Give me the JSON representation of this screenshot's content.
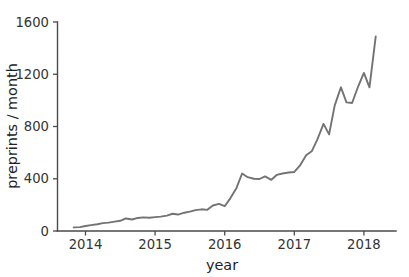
{
  "chart_data": {
    "type": "line",
    "title": "",
    "xlabel": "year",
    "ylabel": "preprints / month",
    "xlim": [
      2013.83,
      2018.25
    ],
    "ylim": [
      0,
      1600
    ],
    "grid": false,
    "legend": false,
    "legend_position": "none",
    "xticks": [
      2014,
      2015,
      2016,
      2017,
      2018
    ],
    "xtick_labels": [
      "2014",
      "2015",
      "2016",
      "2017",
      "2018"
    ],
    "yticks": [
      0,
      400,
      800,
      1200,
      1600
    ],
    "ytick_labels": [
      "0",
      "400",
      "800",
      "1200",
      "1600"
    ],
    "line_color": "#737373",
    "series": [
      {
        "name": "preprints per month",
        "x": [
          2013.83,
          2013.92,
          2014.0,
          2014.08,
          2014.17,
          2014.25,
          2014.33,
          2014.42,
          2014.5,
          2014.58,
          2014.67,
          2014.75,
          2014.83,
          2014.92,
          2015.0,
          2015.08,
          2015.17,
          2015.25,
          2015.33,
          2015.42,
          2015.5,
          2015.58,
          2015.67,
          2015.75,
          2015.83,
          2015.92,
          2016.0,
          2016.08,
          2016.17,
          2016.25,
          2016.33,
          2016.42,
          2016.5,
          2016.58,
          2016.67,
          2016.75,
          2016.83,
          2016.92,
          2017.0,
          2017.08,
          2017.17,
          2017.25,
          2017.33,
          2017.42,
          2017.5,
          2017.58,
          2017.67,
          2017.75,
          2017.83,
          2017.92,
          2018.0,
          2018.08,
          2018.17
        ],
        "values": [
          28,
          30,
          38,
          45,
          52,
          60,
          64,
          72,
          78,
          96,
          88,
          100,
          104,
          102,
          106,
          110,
          118,
          132,
          126,
          140,
          148,
          160,
          166,
          162,
          195,
          208,
          190,
          250,
          330,
          440,
          412,
          400,
          398,
          418,
          392,
          430,
          440,
          448,
          452,
          500,
          580,
          610,
          700,
          820,
          740,
          960,
          1100,
          985,
          980,
          1110,
          1210,
          1100,
          1490
        ]
      }
    ]
  }
}
